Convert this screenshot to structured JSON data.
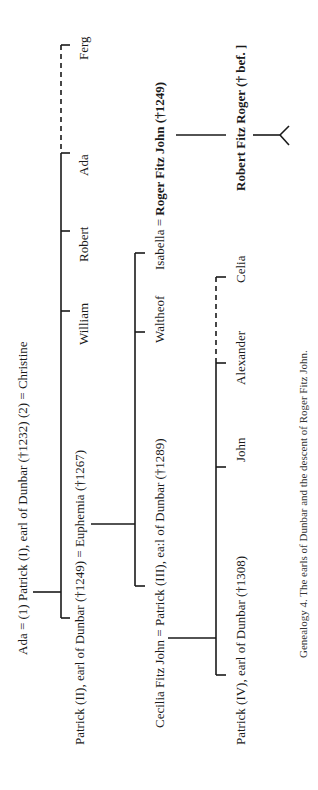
{
  "genealogy": {
    "generation1": {
      "parents_label": "Ada = (1) Patrick (I), earl of Dunbar (†1232) (2) = Christine",
      "children": [
        {
          "label": "Patrick (II), earl of Dunbar (†1249) = Euphemia (†1267)"
        },
        {
          "label": "William"
        },
        {
          "label": "Robert"
        },
        {
          "label": "Ada"
        },
        {
          "label": "Ferg"
        }
      ]
    },
    "generation2": {
      "children": [
        {
          "label": "Cecilia Fitz John = Patrick (III), ea:l of Dunbar (†1289)"
        },
        {
          "label": "Waltheof"
        },
        {
          "label_prefix": "Isabella = ",
          "label_bold": "Roger Fitz John (†1249)"
        }
      ]
    },
    "generation3": {
      "children": [
        {
          "label": "Patrick (IV), earl of Dunbar (†1308)"
        },
        {
          "label": "John"
        },
        {
          "label": "Alexander"
        },
        {
          "label": "Celia"
        }
      ]
    },
    "descent": {
      "label": "Robert Fitz Roger († bef. ]"
    },
    "caption": "Genealogy 4. The earls of Dunbar and the descent of Roger Fitz John."
  }
}
